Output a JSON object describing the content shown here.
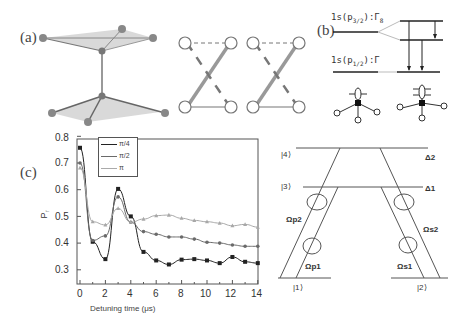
{
  "panels": {
    "a": {
      "label": "(a)"
    },
    "b": {
      "label": "(b)",
      "upper_level": "1s(p3/2):Γ8",
      "upper_level_main": "1s(p",
      "upper_level_sub": "3/2",
      "upper_level_rest": "):Γ",
      "upper_level_gamma_sub": "8",
      "lower_level_main": "1s(p",
      "lower_level_sub": "1/2",
      "lower_level_rest": "):Γ"
    },
    "c": {
      "label": "(c)"
    },
    "d": {
      "levels": [
        "|4⟩",
        "|3⟩",
        "|1⟩",
        "|2⟩"
      ],
      "detunings": [
        "Δ2",
        "Δ1"
      ],
      "couplings": [
        "Ωp2",
        "Ωp1",
        "Ωs2",
        "Ωs1"
      ]
    }
  },
  "chart_data": {
    "type": "line",
    "title": "",
    "xlabel": "Detuning time (μs)",
    "ylabel": "P↑",
    "xlim": [
      -0.3,
      14
    ],
    "ylim": [
      0.25,
      0.8
    ],
    "xticks": [
      0,
      2,
      4,
      6,
      8,
      10,
      12,
      14
    ],
    "yticks": [
      0.3,
      0.4,
      0.5,
      0.6,
      0.7,
      0.8
    ],
    "legend_position": "upper left",
    "grid": false,
    "x": [
      0,
      1,
      2,
      3,
      4,
      5,
      6,
      7,
      8,
      9,
      10,
      11,
      12,
      13,
      14
    ],
    "series": [
      {
        "name": "π/4",
        "marker": "square",
        "color": "#222222",
        "values": [
          0.757,
          0.405,
          0.34,
          0.603,
          0.5,
          0.367,
          0.335,
          0.32,
          0.338,
          0.34,
          0.335,
          0.325,
          0.348,
          0.33,
          0.325
        ]
      },
      {
        "name": "π/2",
        "marker": "circle",
        "color": "#6a6a6a",
        "values": [
          0.7,
          0.41,
          0.427,
          0.573,
          0.478,
          0.443,
          0.433,
          0.423,
          0.423,
          0.415,
          0.403,
          0.4,
          0.393,
          0.388,
          0.388
        ]
      },
      {
        "name": "π",
        "marker": "triangle",
        "color": "#a8a8a8",
        "values": [
          0.682,
          0.48,
          0.468,
          0.53,
          0.478,
          0.49,
          0.503,
          0.505,
          0.493,
          0.485,
          0.48,
          0.475,
          0.465,
          0.47,
          0.46
        ]
      }
    ]
  },
  "legend": {
    "items": [
      "π/4",
      "π/2",
      "π"
    ]
  },
  "axis": {
    "xlabel": "Detuning time (μs)",
    "ylabel": "P",
    "ylabel_sub": "↑",
    "xticks": [
      "0",
      "2",
      "4",
      "6",
      "8",
      "10",
      "12",
      "14"
    ],
    "yticks": [
      "0.3",
      "0.4",
      "0.5",
      "0.6",
      "0.7",
      "0.8"
    ]
  }
}
